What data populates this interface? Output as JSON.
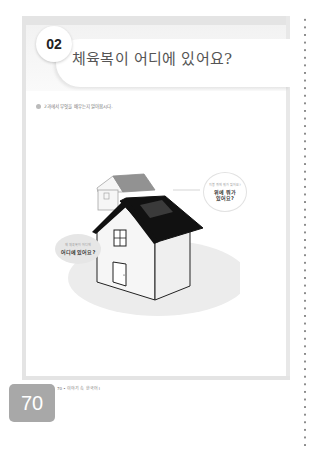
{
  "header": {
    "lesson_number": "02",
    "title": "체육복이 어디에 있어요?"
  },
  "instruction": {
    "icon": "bullet-icon",
    "text": "2과에서 무엇을 배우는지 알아봅시다."
  },
  "illustration": {
    "subject": "house-with-roof",
    "bubble_top": {
      "small": "지붕 위에 뭐가 있어요?",
      "main_line1": "위에 뭐가",
      "main_line2": "있어요?"
    },
    "bubble_left": {
      "small": "제 체육복이 어디에",
      "main": "어디에 있어요?"
    }
  },
  "footer": {
    "text": "70 • 이야기 속 한국어 I",
    "page_number": "70"
  },
  "colors": {
    "frame": "#e4e4e4",
    "page_tab": "#a8a8a8",
    "roof": "#111111",
    "shadow": "#ececec"
  }
}
